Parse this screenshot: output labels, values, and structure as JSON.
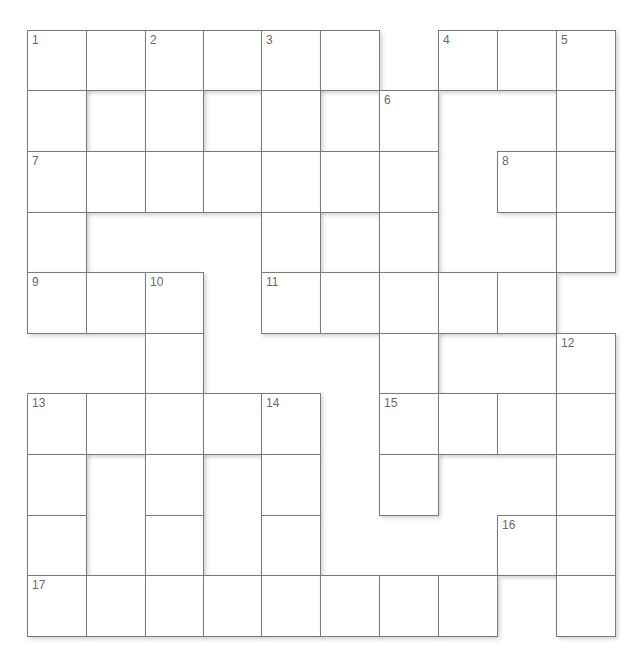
{
  "puzzle": {
    "rows": 10,
    "cols": 10,
    "col_x": [
      27,
      86,
      145,
      203,
      261,
      320,
      379,
      438,
      497,
      556,
      615
    ],
    "row_y": [
      30,
      90,
      151,
      212,
      272,
      333,
      393,
      454,
      515,
      575,
      636
    ],
    "layout": [
      "######.###",
      "#.#.#.#..#",
      "#######.##",
      "#...#.#..#",
      "###.#####.",
      "..#...#..#",
      "#####.####",
      "#.#.#.#..#",
      "#.#.#...##",
      "########.#"
    ],
    "numbers": [
      {
        "row": 0,
        "col": 0,
        "n": "1"
      },
      {
        "row": 0,
        "col": 2,
        "n": "2"
      },
      {
        "row": 0,
        "col": 4,
        "n": "3"
      },
      {
        "row": 0,
        "col": 7,
        "n": "4"
      },
      {
        "row": 0,
        "col": 9,
        "n": "5"
      },
      {
        "row": 1,
        "col": 6,
        "n": "6"
      },
      {
        "row": 2,
        "col": 0,
        "n": "7"
      },
      {
        "row": 2,
        "col": 8,
        "n": "8"
      },
      {
        "row": 4,
        "col": 0,
        "n": "9"
      },
      {
        "row": 4,
        "col": 2,
        "n": "10"
      },
      {
        "row": 4,
        "col": 4,
        "n": "11"
      },
      {
        "row": 5,
        "col": 9,
        "n": "12"
      },
      {
        "row": 6,
        "col": 0,
        "n": "13"
      },
      {
        "row": 6,
        "col": 4,
        "n": "14"
      },
      {
        "row": 6,
        "col": 6,
        "n": "15"
      },
      {
        "row": 8,
        "col": 8,
        "n": "16"
      },
      {
        "row": 9,
        "col": 0,
        "n": "17"
      }
    ]
  },
  "colors": {
    "background": "#ffffff",
    "cell_border": "#7a7a7a",
    "number_text": "#6a6a6a"
  }
}
